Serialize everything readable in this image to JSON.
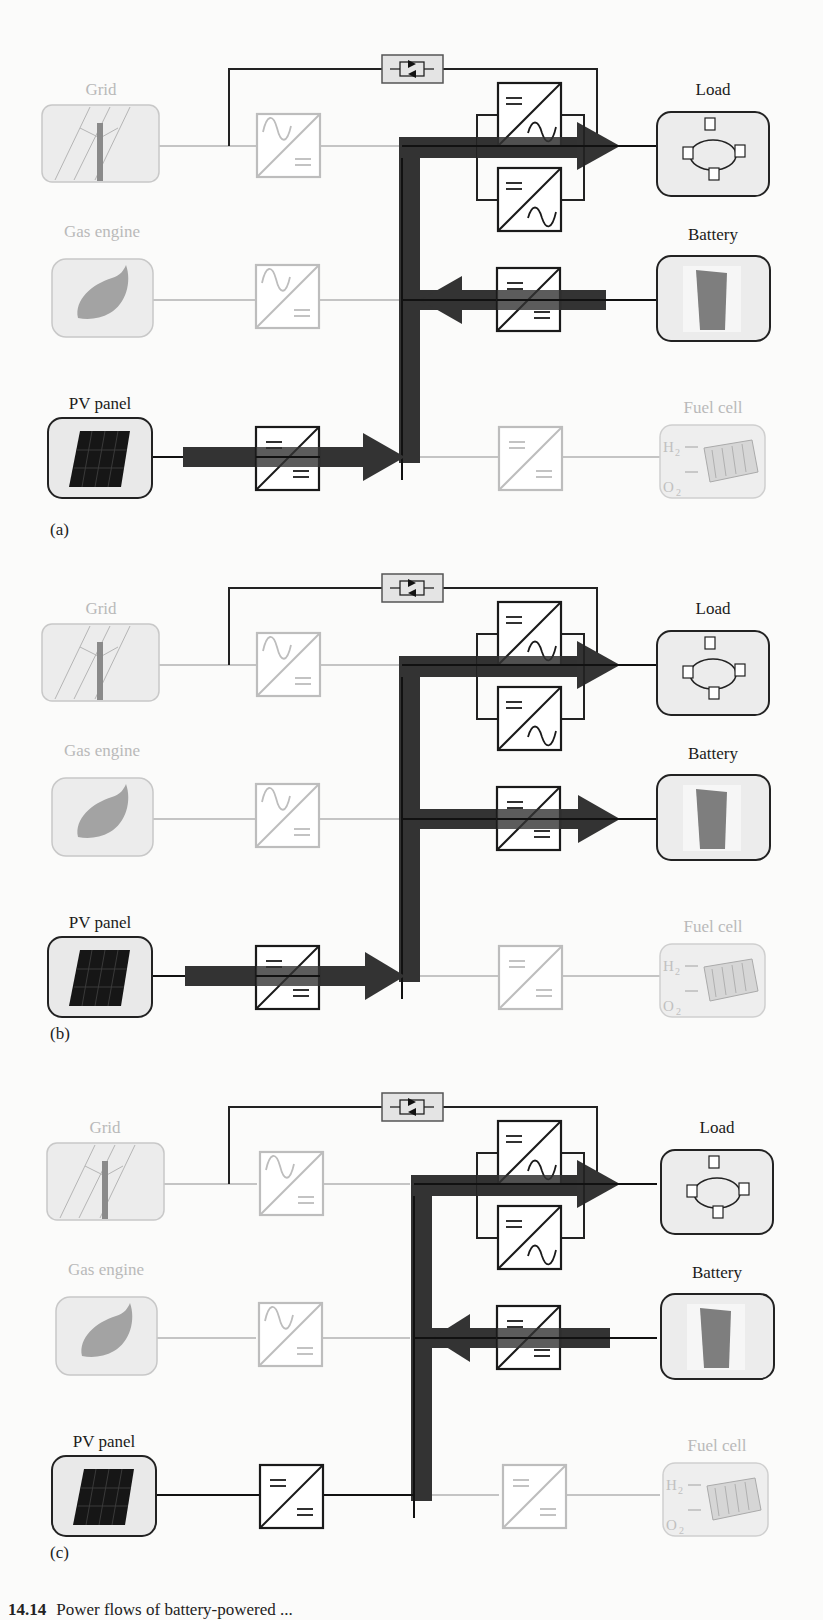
{
  "figure": {
    "caption_number": "14.14",
    "caption_text": "Power flows of battery-powered ...",
    "colors": {
      "active": "#1b1b1b",
      "inactive": "#b9b9b9",
      "flow_arrow": "#333333",
      "box_fill": "#ececec"
    }
  },
  "components": {
    "grid": "Grid",
    "gas_engine": "Gas engine",
    "pv_panel": "PV panel",
    "load": "Load",
    "battery": "Battery",
    "fuel_cell": "Fuel cell"
  },
  "panels": [
    {
      "tag": "(a)",
      "active": [
        "pv_panel",
        "load",
        "battery"
      ],
      "inactive": [
        "grid",
        "gas_engine",
        "fuel_cell"
      ],
      "flows": [
        {
          "from": "pv_panel",
          "to": "bus",
          "arrow": true
        },
        {
          "from": "battery",
          "to": "bus",
          "arrow": true
        },
        {
          "from": "bus",
          "to": "load",
          "arrow": true
        }
      ]
    },
    {
      "tag": "(b)",
      "active": [
        "pv_panel",
        "load",
        "battery"
      ],
      "inactive": [
        "grid",
        "gas_engine",
        "fuel_cell"
      ],
      "flows": [
        {
          "from": "pv_panel",
          "to": "bus",
          "arrow": true
        },
        {
          "from": "bus",
          "to": "battery",
          "arrow": true
        },
        {
          "from": "bus",
          "to": "load",
          "arrow": true
        }
      ]
    },
    {
      "tag": "(c)",
      "active": [
        "pv_panel",
        "load",
        "battery"
      ],
      "inactive": [
        "grid",
        "gas_engine",
        "fuel_cell"
      ],
      "flows": [
        {
          "from": "battery",
          "to": "bus",
          "arrow": true
        },
        {
          "from": "bus",
          "to": "load",
          "arrow": true
        }
      ]
    }
  ],
  "fuel_cell_gases": {
    "h2": "H",
    "h2_sub": "2",
    "o2": "O",
    "o2_sub": "2"
  }
}
